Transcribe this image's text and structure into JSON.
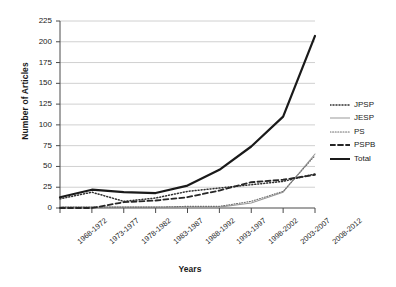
{
  "chart_data": {
    "type": "line",
    "title": "",
    "xlabel": "Years",
    "ylabel": "Number of Articles",
    "ylim": [
      0,
      225
    ],
    "ytick_step": 25,
    "yticks": [
      "225",
      "200",
      "175",
      "150",
      "125",
      "100",
      "75",
      "50",
      "25",
      "0"
    ],
    "grid": "horizontal",
    "legend_position": "right",
    "categories": [
      "1968-1972",
      "1973-1977",
      "1978-1982",
      "1983-1987",
      "1988-1992",
      "1993-1997",
      "1998-2002",
      "2003-2007",
      "2008-2012"
    ],
    "series": [
      {
        "name": "JPSP",
        "style": "dotted",
        "color": "#303030",
        "width": 1.5,
        "dash": "1,2",
        "values": [
          11,
          19,
          8,
          12,
          20,
          24,
          28,
          32,
          41
        ]
      },
      {
        "name": "JESP",
        "style": "solid-thin",
        "color": "#9a9a9a",
        "width": 1.1,
        "dash": "",
        "values": [
          1,
          1,
          1,
          1,
          1,
          1,
          6,
          19,
          65
        ]
      },
      {
        "name": "PS",
        "style": "dotted-fine",
        "color": "#6e6e6e",
        "width": 1.1,
        "dash": "1,1.6",
        "values": [
          1,
          1,
          1,
          1,
          2,
          2,
          8,
          20,
          63
        ]
      },
      {
        "name": "PSPB",
        "style": "dashed",
        "color": "#262626",
        "width": 1.8,
        "dash": "5,3",
        "values": [
          0,
          0,
          7,
          9,
          13,
          21,
          31,
          34,
          40
        ]
      },
      {
        "name": "Total",
        "style": "solid-thick",
        "color": "#1a1a1a",
        "width": 2.2,
        "dash": "",
        "values": [
          13,
          22,
          19,
          18,
          27,
          46,
          74,
          110,
          207
        ]
      }
    ]
  }
}
